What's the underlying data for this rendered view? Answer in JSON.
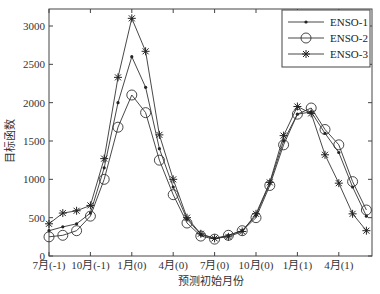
{
  "chart_data": {
    "type": "line",
    "title": "",
    "xlabel": "预测初始月份",
    "ylabel": "目标函数",
    "ylim": [
      0,
      3200
    ],
    "yticks": [
      0,
      500,
      1000,
      1500,
      2000,
      2500,
      3000
    ],
    "xtick_labels": [
      "7月(-1)",
      "10月(-1)",
      "1月(0)",
      "4月(0)",
      "7月(0)",
      "10月(0)",
      "1月(1)",
      "4月(1)"
    ],
    "xtick_indices": [
      0,
      3,
      6,
      9,
      12,
      15,
      18,
      21
    ],
    "x_count": 24,
    "grid": false,
    "legend_position": "upper right",
    "series": [
      {
        "name": "ENSO-1",
        "marker": "dot",
        "values": [
          330,
          380,
          420,
          560,
          1150,
          2000,
          2600,
          2200,
          1400,
          900,
          480,
          280,
          230,
          270,
          330,
          530,
          950,
          1500,
          1850,
          1880,
          1600,
          1350,
          900,
          520
        ]
      },
      {
        "name": "ENSO-2",
        "marker": "circle",
        "values": [
          250,
          270,
          330,
          520,
          1000,
          1680,
          2100,
          1870,
          1250,
          800,
          430,
          260,
          220,
          270,
          330,
          500,
          920,
          1450,
          1850,
          1930,
          1650,
          1450,
          970,
          600
        ]
      },
      {
        "name": "ENSO-3",
        "marker": "star",
        "values": [
          420,
          560,
          590,
          660,
          1270,
          2330,
          3100,
          2670,
          1580,
          1000,
          500,
          290,
          230,
          250,
          320,
          550,
          960,
          1570,
          1950,
          1860,
          1320,
          950,
          550,
          330
        ]
      }
    ]
  }
}
